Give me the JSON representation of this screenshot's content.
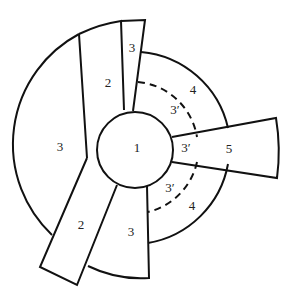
{
  "diagram": {
    "type": "region-partition",
    "colors": {
      "stroke": "#111111",
      "background": "#ffffff",
      "text": "#222222"
    },
    "labels": {
      "center": "1",
      "top_left_strip": "2",
      "top_thin_strip": "3",
      "left_region": "3",
      "bottom_left_strip": "2",
      "bottom_region": "3",
      "upper_right_outer": "4",
      "upper_right_inner": "3′",
      "right_inner": "3′",
      "right_strip": "5",
      "lower_right_inner": "3′",
      "lower_right_outer": "4"
    }
  }
}
